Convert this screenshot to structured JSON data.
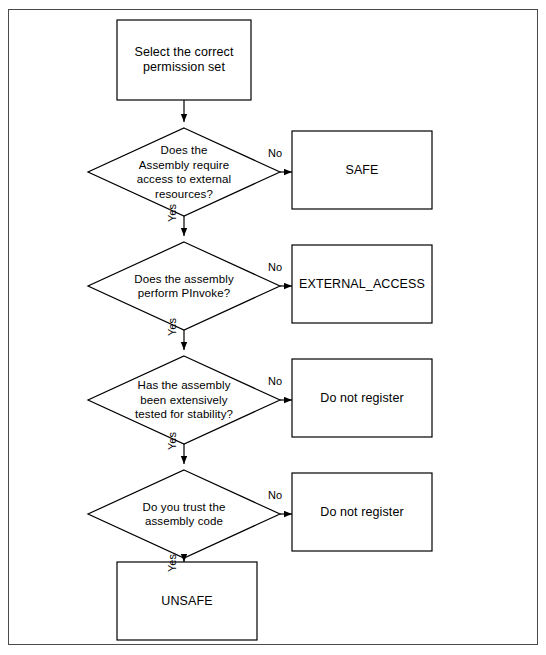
{
  "diagram": {
    "title_text": "",
    "background_color": "#ffffff",
    "stroke_color": "#000000",
    "frame_color": "#4a4a4a",
    "nodes": [
      {
        "id": "start",
        "type": "process",
        "text": "Select the correct\npermission set",
        "line1": "Select the correct",
        "line2": "permission set"
      },
      {
        "id": "d1",
        "type": "decision",
        "line1": "Does the",
        "line2": "Assembly require",
        "line3": "access to external",
        "line4": "resources?"
      },
      {
        "id": "safe",
        "type": "process",
        "line1": "SAFE"
      },
      {
        "id": "d2",
        "type": "decision",
        "line1": "Does the assembly",
        "line2": "perform PInvoke?"
      },
      {
        "id": "ext",
        "type": "process",
        "line1": "EXTERNAL_ACCESS"
      },
      {
        "id": "d3",
        "type": "decision",
        "line1": "Has the assembly",
        "line2": "been extensively",
        "line3": "tested for stability?"
      },
      {
        "id": "dnr1",
        "type": "process",
        "line1": "Do not register"
      },
      {
        "id": "d4",
        "type": "decision",
        "line1": "Do you trust the",
        "line2": "assembly code"
      },
      {
        "id": "dnr2",
        "type": "process",
        "line1": "Do not register"
      },
      {
        "id": "unsafe",
        "type": "process",
        "line1": "UNSAFE"
      }
    ],
    "edge_labels": {
      "no1": "No",
      "no2": "No",
      "no3": "No",
      "no4": "No",
      "yes1": "Yes",
      "yes2": "Yes",
      "yes3": "Yes",
      "yes4": "Yes"
    }
  }
}
